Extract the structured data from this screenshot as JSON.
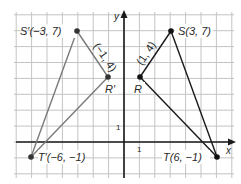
{
  "diagram": {
    "title": "",
    "axes": {
      "x_label": "x",
      "y_label": "y",
      "x_unit_label": "1",
      "y_unit_label": "1"
    },
    "grid": {
      "x_min": -7,
      "x_max": 7,
      "y_min": -2,
      "y_max": 8,
      "line_color": "#bdbdbd",
      "axis_color": "#1a1a1a"
    },
    "original_triangle": {
      "color": "#1a1a1a",
      "vertices": [
        {
          "name": "S",
          "x": 3,
          "y": 7,
          "label": "S(3, 7)"
        },
        {
          "name": "R",
          "x": 1,
          "y": 4,
          "label": "R"
        },
        {
          "name": "T",
          "x": 6,
          "y": -1,
          "label": "T(6, −1)"
        }
      ],
      "side_label": "(1, 4)"
    },
    "image_triangle": {
      "color": "#7a7a7a",
      "vertices": [
        {
          "name": "S'",
          "x": -3,
          "y": 7,
          "label": "S′(−3, 7)"
        },
        {
          "name": "R'",
          "x": -1,
          "y": 4,
          "label": "R′"
        },
        {
          "name": "T'",
          "x": -6,
          "y": -1,
          "label": "T′(−6, −1)"
        }
      ],
      "side_label": "(−1, 4)"
    }
  }
}
